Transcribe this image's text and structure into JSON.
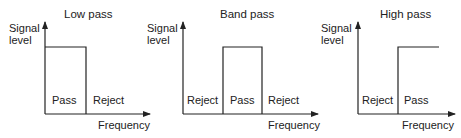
{
  "panels": [
    {
      "title": "Low pass",
      "y_label": [
        "Signal",
        "level"
      ],
      "x_label": "Frequency",
      "regions": [
        "Pass",
        "Reject"
      ]
    },
    {
      "title": "Band pass",
      "y_label": [
        "Signal",
        "level"
      ],
      "x_label": "Frequency",
      "regions": [
        "Reject",
        "Pass",
        "Reject"
      ]
    },
    {
      "title": "High pass",
      "y_label": [
        "Signal",
        "level"
      ],
      "x_label": "Frequency",
      "regions": [
        "Reject",
        "Pass"
      ]
    }
  ],
  "colors": {
    "line": "#222222",
    "background": "#ffffff"
  }
}
